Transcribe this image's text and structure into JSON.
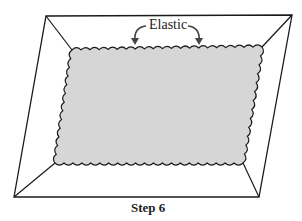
{
  "diagram": {
    "caption": "Step 6",
    "callout_label": "Elastic",
    "colors": {
      "stroke": "#1a1a1a",
      "fabric_fill": "#d6d6d6",
      "background": "#ffffff"
    },
    "outer_frame": {
      "shape": "parallelogram",
      "corners": [
        [
          46,
          16
        ],
        [
          292,
          15
        ],
        [
          259,
          197
        ],
        [
          14,
          197
        ]
      ]
    },
    "inner_fabric": {
      "shape": "wavy-edged quadrilateral",
      "corners": [
        [
          72,
          50
        ],
        [
          262,
          47
        ],
        [
          243,
          163
        ],
        [
          55,
          163
        ]
      ]
    }
  }
}
